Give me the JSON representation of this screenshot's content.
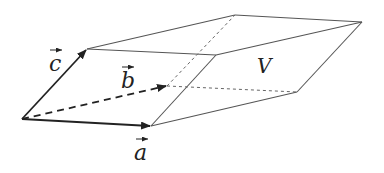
{
  "diagram": {
    "colors": {
      "line": "#333333",
      "edge": "#555555",
      "hidden": "#666666",
      "background": "#ffffff"
    },
    "vertices": {
      "O": [
        22,
        119
      ],
      "A": [
        151,
        126
      ],
      "B": [
        167,
        86
      ],
      "C": [
        87,
        49
      ],
      "AC": [
        216,
        55
      ],
      "BC": [
        235,
        15
      ],
      "AB": [
        297,
        92
      ],
      "ABC": [
        362,
        22
      ]
    },
    "vectors": [
      {
        "name": "a",
        "label": "a",
        "from": "O",
        "to": "A",
        "style": "solid"
      },
      {
        "name": "b",
        "label": "b",
        "from": "O",
        "to": "B",
        "style": "dashed"
      },
      {
        "name": "c",
        "label": "c",
        "from": "O",
        "to": "C",
        "style": "solid"
      }
    ],
    "volume_label": "V"
  }
}
